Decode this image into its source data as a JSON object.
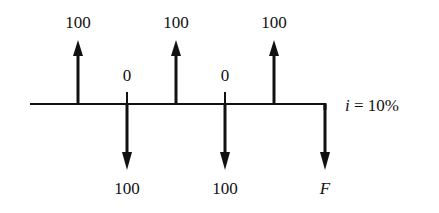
{
  "diagram": {
    "type": "cash-flow-diagram",
    "interest_rate_label": "i = 10%",
    "interest_symbol": "i",
    "interest_value": "= 10%",
    "periods": [
      {
        "index": 1,
        "direction": "up",
        "label": "100"
      },
      {
        "index": 2,
        "direction": "down",
        "top_label": "0",
        "label": "100"
      },
      {
        "index": 3,
        "direction": "up",
        "label": "100"
      },
      {
        "index": 4,
        "direction": "down",
        "top_label": "0",
        "label": "100"
      },
      {
        "index": 5,
        "direction": "up",
        "label": "100"
      },
      {
        "index": 6,
        "direction": "down",
        "label": "F"
      }
    ],
    "colors": {
      "line": "#111111",
      "background": "#ffffff"
    }
  }
}
